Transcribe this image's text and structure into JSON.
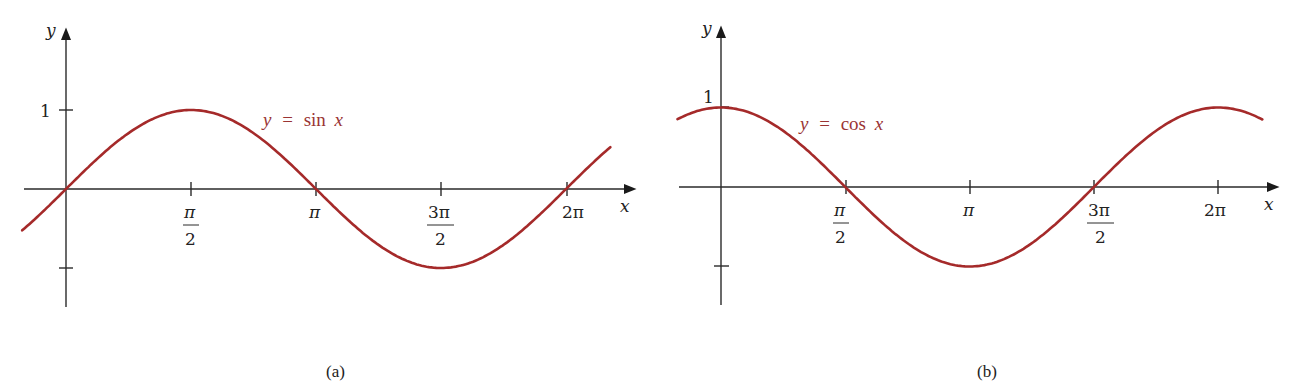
{
  "chart_data": [
    {
      "type": "line",
      "panel": "(a)",
      "title": "",
      "function": "sin",
      "curve_label": "y = sin x",
      "xlabel": "x",
      "ylabel": "y",
      "x_ticks": [
        "π/2",
        "π",
        "3π/2",
        "2π"
      ],
      "x_tick_values": [
        1.5708,
        3.1416,
        4.7124,
        6.2832
      ],
      "y_ticks": [
        "1",
        "-1"
      ],
      "y_tick_values": [
        1,
        -1
      ],
      "y_tick_labels_visible": [
        "1"
      ],
      "xlim": [
        -0.55,
        6.84
      ],
      "ylim": [
        -1,
        1
      ],
      "grid": false,
      "color": "#a52a2a",
      "series": [
        {
          "name": "y = sin x",
          "x": [
            -0.55,
            0,
            0.7854,
            1.5708,
            2.3562,
            3.1416,
            3.927,
            4.7124,
            5.4978,
            6.2832,
            6.84
          ],
          "values": [
            -0.52,
            0,
            0.707,
            1,
            0.707,
            0,
            -0.707,
            -1,
            -0.707,
            0,
            0.52
          ]
        }
      ]
    },
    {
      "type": "line",
      "panel": "(b)",
      "title": "",
      "function": "cos",
      "curve_label": "y = cos x",
      "xlabel": "x",
      "ylabel": "y",
      "x_ticks": [
        "π/2",
        "π",
        "3π/2",
        "2π"
      ],
      "x_tick_values": [
        1.5708,
        3.1416,
        4.7124,
        6.2832
      ],
      "y_ticks": [
        "1",
        "-1"
      ],
      "y_tick_values": [
        1,
        -1
      ],
      "y_tick_labels_visible": [
        "1"
      ],
      "xlim": [
        -0.55,
        6.84
      ],
      "ylim": [
        -1,
        1
      ],
      "grid": false,
      "color": "#a52a2a",
      "series": [
        {
          "name": "y = cos x",
          "x": [
            -0.55,
            0,
            0.7854,
            1.5708,
            2.3562,
            3.1416,
            3.927,
            4.7124,
            5.4978,
            6.2832,
            6.84
          ],
          "values": [
            0.85,
            1,
            0.707,
            0,
            -0.707,
            -1,
            -0.707,
            0,
            0.707,
            1,
            0.85
          ]
        }
      ]
    }
  ],
  "panels": {
    "a": {
      "caption": "(a)",
      "equation": {
        "y": "y",
        "eq": "=",
        "fn": "sin",
        "x": "x"
      },
      "y_axis_label": "y",
      "x_axis_label": "x",
      "y_tick_one": "1",
      "ticks": {
        "half_pi_num": "π",
        "half_pi_den": "2",
        "pi": "π",
        "three_half_num": "3π",
        "three_half_den": "2",
        "two_pi": "2π"
      }
    },
    "b": {
      "caption": "(b)",
      "equation": {
        "y": "y",
        "eq": "=",
        "fn": "cos",
        "x": "x"
      },
      "y_axis_label": "y",
      "x_axis_label": "x",
      "y_tick_one": "1",
      "ticks": {
        "half_pi_num": "π",
        "half_pi_den": "2",
        "pi": "π",
        "three_half_num": "3π",
        "three_half_den": "2",
        "two_pi": "2π"
      }
    }
  }
}
